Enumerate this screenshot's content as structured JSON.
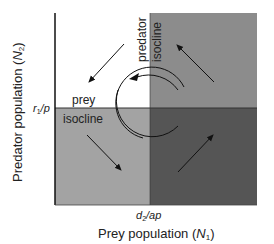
{
  "diagram": {
    "x_axis_label": "Prey population (N₁)",
    "x_axis_label_parts": {
      "main": "Prey population (",
      "var": "N",
      "sub": "1",
      "close": ")"
    },
    "y_axis_label_parts": {
      "main": "Predator population (",
      "var": "N",
      "sub": "2",
      "close": ")"
    },
    "x_tick_label": "d₂/ap",
    "y_tick_label": "r₁/p",
    "x_tick_parts": {
      "a": "d",
      "sub": "2",
      "b": "/ap"
    },
    "y_tick_parts": {
      "a": "r",
      "sub": "1",
      "b": "/p"
    },
    "prey_isocline_label": [
      "prey",
      "isocline"
    ],
    "predator_isocline_label": [
      "predator",
      "isocline"
    ],
    "quadrants": {
      "top_left": {
        "color": "#ffffff",
        "arrow": "down-left"
      },
      "top_right": {
        "color": "#8c8c8c",
        "arrow": "up-left"
      },
      "bottom_left": {
        "color": "#a3a3a3",
        "arrow": "down-right"
      },
      "bottom_right": {
        "color": "#555555",
        "arrow": "up-right"
      }
    },
    "cycle_direction": "counterclockwise"
  }
}
